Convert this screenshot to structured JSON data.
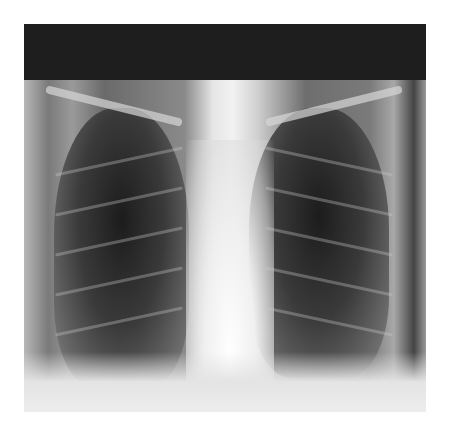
{
  "image": {
    "subject": "chest x-ray (posteroanterior view)",
    "description": "Grayscale frontal chest radiograph with dark band along top edge, bright central mediastinum, dark lung fields with visible ribs, and bright diaphragm at bottom",
    "colors": {
      "top_band": "#1e1e1e",
      "lung_field": "#2c2c2c",
      "mediastinum": "#f2f2f2",
      "background": "#ffffff"
    }
  }
}
